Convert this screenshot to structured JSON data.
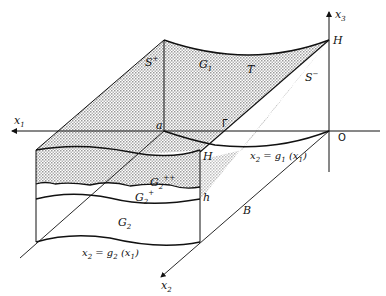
{
  "figure": {
    "axes": {
      "x1": {
        "base": "x",
        "sub": "1"
      },
      "x2": {
        "base": "x",
        "sub": "2"
      },
      "x3": {
        "base": "x",
        "sub": "3"
      }
    },
    "points": {
      "H_top": "H",
      "H_front": "H",
      "origin": "O",
      "a": "a"
    },
    "regions": {
      "S_plus": {
        "base": "S",
        "sup": "+"
      },
      "S_minus": {
        "base": "S",
        "sup": "−"
      },
      "G1": {
        "base": "G",
        "sub": "1"
      },
      "T": "T",
      "Gamma": "Γ",
      "G2pp": {
        "base": "G",
        "sub": "2",
        "sup": "++"
      },
      "G2p": {
        "base": "G",
        "sub": "2",
        "sup": "+"
      },
      "G2": {
        "base": "G",
        "sub": "2"
      }
    },
    "dimensions": {
      "h": "h",
      "B": "B"
    },
    "curves": {
      "g1": {
        "lhs": "x",
        "lhs_sub": "2",
        "eq": " = ",
        "fn": "g",
        "fn_sub": "1",
        "arg": "x",
        "arg_sub": "1"
      },
      "g2": {
        "lhs": "x",
        "lhs_sub": "2",
        "eq": " = ",
        "fn": "g",
        "fn_sub": "2",
        "arg": "x",
        "arg_sub": "1"
      }
    },
    "colors": {
      "line": "#111111",
      "shade": "#bdbdbd",
      "background": "#ffffff"
    }
  }
}
